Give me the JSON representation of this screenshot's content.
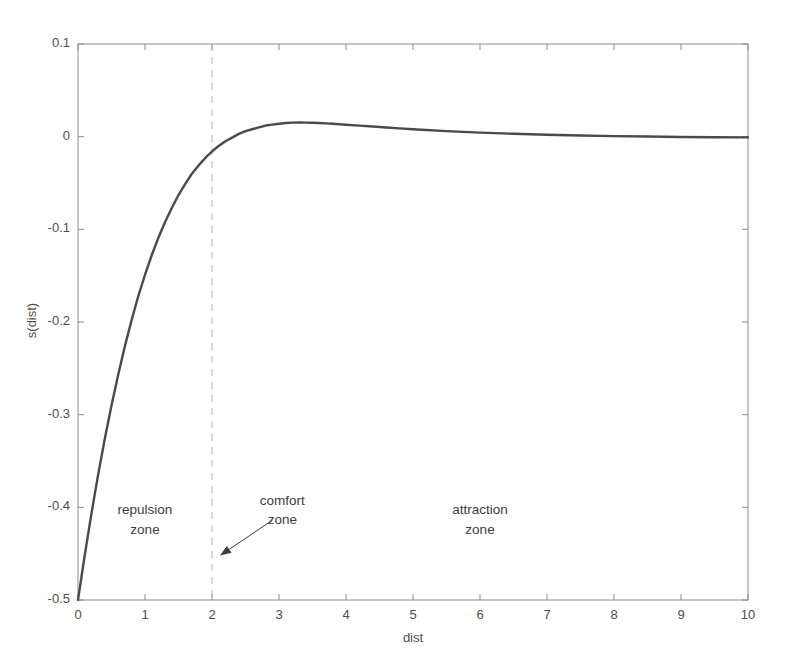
{
  "chart_data": {
    "type": "line",
    "title": "",
    "subtitle": "",
    "xlabel": "dist",
    "ylabel": "s(dist)",
    "xlim": [
      0,
      10
    ],
    "ylim": [
      -0.5,
      0.1
    ],
    "xticks": [
      "0",
      "1",
      "2",
      "3",
      "4",
      "5",
      "6",
      "7",
      "8",
      "9",
      "10"
    ],
    "xtick_values": [
      0,
      1,
      2,
      3,
      4,
      5,
      6,
      7,
      8,
      9,
      10
    ],
    "yticks": [
      "0.1",
      "0",
      "-0.1",
      "-0.2",
      "-0.3",
      "-0.4",
      "-0.5"
    ],
    "ytick_values": [
      0.1,
      0,
      -0.1,
      -0.2,
      -0.3,
      -0.4,
      -0.5
    ],
    "grid": false,
    "legend": "none",
    "line_color": "#4a4a4a",
    "line_width": 2.4,
    "axis_color": "#8c8c8c",
    "series": [
      {
        "name": "s(dist)",
        "x": [
          0.0,
          0.1,
          0.2,
          0.3,
          0.4,
          0.5,
          0.6,
          0.7,
          0.8,
          0.9,
          1.0,
          1.1,
          1.2,
          1.3,
          1.4,
          1.5,
          1.6,
          1.7,
          1.8,
          1.9,
          2.0,
          2.1,
          2.2,
          2.3,
          2.4,
          2.5,
          2.6,
          2.7,
          2.8,
          2.9,
          3.0,
          3.1,
          3.2,
          3.3,
          3.4,
          3.5,
          3.6,
          3.7,
          3.8,
          3.9,
          4.0,
          4.2,
          4.4,
          4.6,
          4.8,
          5.0,
          5.5,
          6.0,
          6.5,
          7.0,
          7.5,
          8.0,
          8.5,
          9.0,
          9.5,
          10.0
        ],
        "y": [
          -0.5,
          -0.452,
          -0.407,
          -0.365,
          -0.326,
          -0.29,
          -0.257,
          -0.226,
          -0.198,
          -0.172,
          -0.149,
          -0.128,
          -0.109,
          -0.092,
          -0.077,
          -0.063,
          -0.051,
          -0.04,
          -0.031,
          -0.023,
          -0.016,
          -0.01,
          -0.005,
          -0.001,
          0.003,
          0.006,
          0.008,
          0.01,
          0.012,
          0.013,
          0.014,
          0.0148,
          0.0152,
          0.0153,
          0.0152,
          0.015,
          0.0147,
          0.0143,
          0.0139,
          0.0134,
          0.0129,
          0.0119,
          0.0109,
          0.0099,
          0.0089,
          0.008,
          0.006,
          0.0044,
          0.0031,
          0.0021,
          0.0013,
          0.0006,
          0.0001,
          -0.0003,
          -0.0006,
          -0.0008
        ]
      }
    ],
    "annotations": [
      {
        "name": "repulsion-zone",
        "lines": [
          "repulsion",
          "zone"
        ],
        "x_data": 1.0,
        "y_data": -0.403
      },
      {
        "name": "comfort-zone",
        "lines": [
          "comfort",
          "zone"
        ],
        "x_data": 3.05,
        "y_data": -0.393
      },
      {
        "name": "attraction-zone",
        "lines": [
          "attraction",
          "zone"
        ],
        "x_data": 6.0,
        "y_data": -0.403
      }
    ],
    "arrow": {
      "name": "comfort-zone-arrow",
      "from_x": 2.9,
      "from_y": -0.414,
      "to_x": 2.12,
      "to_y": -0.452
    },
    "vline": {
      "name": "comfort-boundary",
      "x_data": 2.0,
      "style": "dashed",
      "color": "#b4b4b4"
    }
  }
}
